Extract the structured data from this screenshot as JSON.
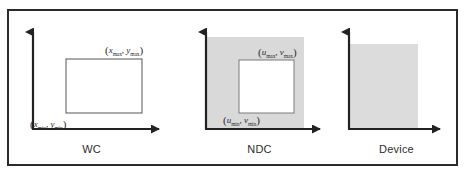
{
  "figure": {
    "border_color": "#2b2b2b",
    "background": "#ffffff",
    "axis_color": "#222222",
    "box_outline_color": "#555555",
    "shaded_fill": "#d9d9d9"
  },
  "panels": [
    {
      "id": "wc",
      "caption": "WC",
      "shaded": false,
      "rect_fill": "#ffffff",
      "labels": [
        {
          "id": "wc-max",
          "open": "(",
          "x_var": "x",
          "x_sub": "max",
          "comma": ",",
          "y_var": "y",
          "y_sub": "max",
          "close": ")"
        },
        {
          "id": "wc-min",
          "open": "(",
          "x_var": "x",
          "x_sub": "min",
          "comma": ",",
          "y_var": "y",
          "y_sub": "min",
          "close": ")"
        }
      ]
    },
    {
      "id": "ndc",
      "caption": "NDC",
      "shaded": true,
      "rect_fill": "#ffffff",
      "labels": [
        {
          "id": "ndc-max",
          "open": "(",
          "x_var": "u",
          "x_sub": "max",
          "comma": ",",
          "y_var": "v",
          "y_sub": "max",
          "close": ")"
        },
        {
          "id": "ndc-min",
          "open": "(",
          "x_var": "u",
          "x_sub": "min",
          "comma": ",",
          "y_var": "v",
          "y_sub": "min",
          "close": ")"
        }
      ]
    },
    {
      "id": "device",
      "caption": "Device",
      "shaded": true,
      "rect_fill": "#dcdcdc",
      "labels": []
    }
  ]
}
